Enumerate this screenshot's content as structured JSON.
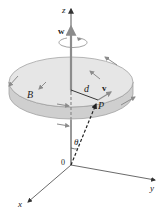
{
  "figure": {
    "type": "rotating-disk-vector-diagram",
    "labels": {
      "z_axis": "z",
      "y_axis": "y",
      "x_axis": "x",
      "origin": "0",
      "angular_velocity": "w",
      "point_b": "B",
      "distance": "d",
      "velocity": "v",
      "point_p": "P",
      "angle": "θ"
    },
    "colors": {
      "disk_top": "#e6e6e6",
      "disk_side": "#cfcfcf",
      "disk_edge": "#9a9a9a",
      "vector_gray": "#8c8c8c",
      "axis_line": "#444444",
      "dark_vector": "#222222"
    }
  }
}
